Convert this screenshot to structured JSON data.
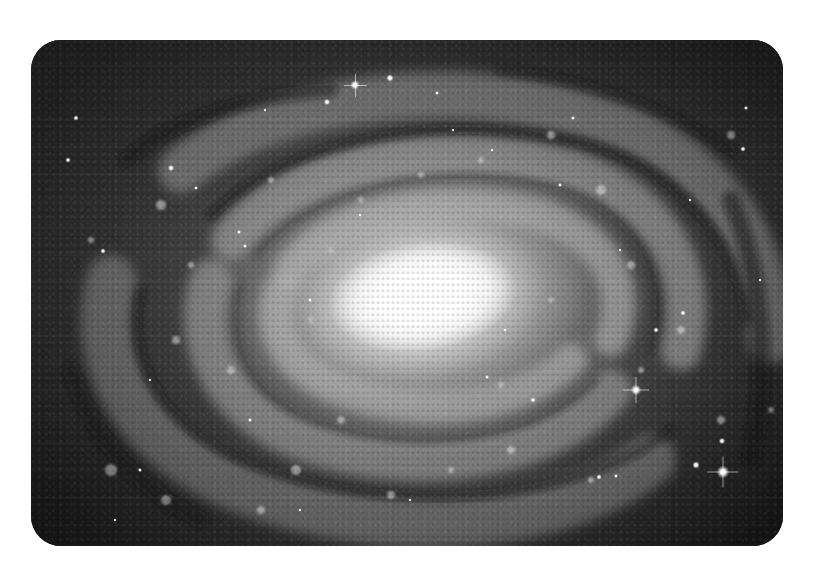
{
  "image": {
    "subject": "Spiral galaxy (grayscale telescope photograph)",
    "frame": {
      "x": 31,
      "y": 40,
      "width": 752,
      "height": 506,
      "corner_radius": 30
    },
    "page_background": "#ffffff",
    "colors": {
      "deep_space": "#1c1c1c",
      "arm_light": "#a8a8a8",
      "dust_lane": "#2e2e2e",
      "core": "#ffffff"
    },
    "core_center": {
      "x": 420,
      "y": 297
    },
    "stars": [
      {
        "x": 355,
        "y": 85,
        "size": 9,
        "spike": true
      },
      {
        "x": 390,
        "y": 78,
        "size": 7,
        "spike": false
      },
      {
        "x": 327,
        "y": 102,
        "size": 6,
        "spike": false
      },
      {
        "x": 437,
        "y": 93,
        "size": 4,
        "spike": false
      },
      {
        "x": 636,
        "y": 390,
        "size": 10,
        "spike": true
      },
      {
        "x": 723,
        "y": 472,
        "size": 12,
        "spike": true
      },
      {
        "x": 696,
        "y": 465,
        "size": 7,
        "spike": false
      },
      {
        "x": 722,
        "y": 441,
        "size": 6,
        "spike": false
      },
      {
        "x": 599,
        "y": 477,
        "size": 5,
        "spike": false
      },
      {
        "x": 616,
        "y": 476,
        "size": 4,
        "spike": false
      },
      {
        "x": 68,
        "y": 160,
        "size": 5,
        "spike": false
      },
      {
        "x": 76,
        "y": 118,
        "size": 5,
        "spike": false
      },
      {
        "x": 171,
        "y": 168,
        "size": 6,
        "spike": false
      },
      {
        "x": 103,
        "y": 251,
        "size": 5,
        "spike": false
      },
      {
        "x": 196,
        "y": 188,
        "size": 4,
        "spike": false
      },
      {
        "x": 239,
        "y": 232,
        "size": 4,
        "spike": false
      },
      {
        "x": 245,
        "y": 246,
        "size": 4,
        "spike": false
      },
      {
        "x": 656,
        "y": 330,
        "size": 5,
        "spike": false
      },
      {
        "x": 683,
        "y": 313,
        "size": 5,
        "spike": false
      },
      {
        "x": 743,
        "y": 149,
        "size": 5,
        "spike": false
      },
      {
        "x": 746,
        "y": 108,
        "size": 4,
        "spike": false
      },
      {
        "x": 533,
        "y": 400,
        "size": 5,
        "spike": false
      },
      {
        "x": 487,
        "y": 377,
        "size": 4,
        "spike": false
      },
      {
        "x": 560,
        "y": 185,
        "size": 4,
        "spike": false
      },
      {
        "x": 573,
        "y": 118,
        "size": 4,
        "spike": false
      },
      {
        "x": 492,
        "y": 150,
        "size": 3,
        "spike": false
      },
      {
        "x": 453,
        "y": 130,
        "size": 3,
        "spike": false
      },
      {
        "x": 250,
        "y": 420,
        "size": 4,
        "spike": false
      },
      {
        "x": 140,
        "y": 470,
        "size": 4,
        "spike": false
      },
      {
        "x": 115,
        "y": 520,
        "size": 3,
        "spike": false
      },
      {
        "x": 300,
        "y": 510,
        "size": 3,
        "spike": false
      },
      {
        "x": 410,
        "y": 500,
        "size": 3,
        "spike": false
      },
      {
        "x": 620,
        "y": 250,
        "size": 3,
        "spike": false
      },
      {
        "x": 360,
        "y": 215,
        "size": 3,
        "spike": false
      },
      {
        "x": 310,
        "y": 300,
        "size": 4,
        "spike": false
      },
      {
        "x": 505,
        "y": 330,
        "size": 3,
        "spike": false
      },
      {
        "x": 265,
        "y": 110,
        "size": 3,
        "spike": false
      },
      {
        "x": 150,
        "y": 380,
        "size": 3,
        "spike": false
      },
      {
        "x": 690,
        "y": 200,
        "size": 3,
        "spike": false
      },
      {
        "x": 760,
        "y": 280,
        "size": 3,
        "spike": false
      }
    ]
  }
}
